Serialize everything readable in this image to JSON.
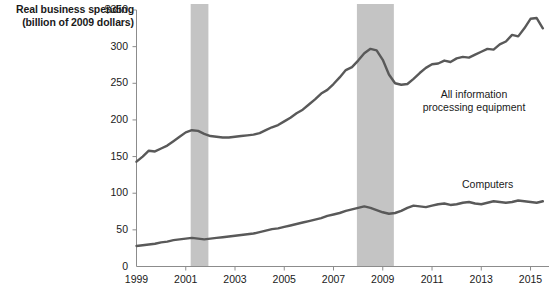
{
  "chart_data": {
    "type": "line",
    "title": "Real business spending (billion of 2009 dollars)",
    "title_line1": "Real business spending",
    "title_line2": "(billion of 2009 dollars)",
    "xlabel": "",
    "ylabel": "Real business spending (billion of 2009 dollars)",
    "ylim": [
      0,
      350
    ],
    "xlim": [
      1999,
      2015.75
    ],
    "y_ticks": [
      0,
      50,
      100,
      150,
      200,
      250,
      300,
      350
    ],
    "y_tick_labels": [
      "0",
      "50",
      "100",
      "150",
      "200",
      "250",
      "300",
      "$350"
    ],
    "x_ticks": [
      1999,
      2001,
      2003,
      2005,
      2007,
      2009,
      2011,
      2013,
      2015
    ],
    "x_tick_labels": [
      "1999",
      "2001",
      "2003",
      "2005",
      "2007",
      "2009",
      "2011",
      "2013",
      "2015"
    ],
    "grid": false,
    "legend_position": "inline-annotations",
    "line_color": "#595959",
    "shaded_band_color": "#c4c4c4",
    "axis_color": "#8c8c8c",
    "recession_bands": [
      {
        "start": 2001.2,
        "end": 2001.92
      },
      {
        "start": 2007.95,
        "end": 2009.45
      }
    ],
    "series": [
      {
        "name": "All information processing equipment",
        "color": "#595959",
        "x": [
          1999.0,
          1999.25,
          1999.5,
          1999.75,
          2000.0,
          2000.25,
          2000.5,
          2000.75,
          2001.0,
          2001.25,
          2001.5,
          2001.75,
          2002.0,
          2002.25,
          2002.5,
          2002.75,
          2003.0,
          2003.25,
          2003.5,
          2003.75,
          2004.0,
          2004.25,
          2004.5,
          2004.75,
          2005.0,
          2005.25,
          2005.5,
          2005.75,
          2006.0,
          2006.25,
          2006.5,
          2006.75,
          2007.0,
          2007.25,
          2007.5,
          2007.75,
          2008.0,
          2008.25,
          2008.5,
          2008.75,
          2009.0,
          2009.25,
          2009.5,
          2009.75,
          2010.0,
          2010.25,
          2010.5,
          2010.75,
          2011.0,
          2011.25,
          2011.5,
          2011.75,
          2012.0,
          2012.25,
          2012.5,
          2012.75,
          2013.0,
          2013.25,
          2013.5,
          2013.75,
          2014.0,
          2014.25,
          2014.5,
          2014.75,
          2015.0,
          2015.25,
          2015.5
        ],
        "values": [
          143,
          150,
          158,
          157,
          161,
          165,
          171,
          177,
          183,
          186,
          185,
          181,
          178,
          177,
          176,
          176,
          177,
          178,
          179,
          180,
          182,
          186,
          190,
          193,
          198,
          203,
          209,
          214,
          221,
          228,
          236,
          241,
          249,
          258,
          268,
          272,
          281,
          291,
          297,
          295,
          282,
          262,
          250,
          248,
          249,
          256,
          264,
          271,
          276,
          277,
          281,
          279,
          284,
          286,
          285,
          289,
          293,
          297,
          296,
          303,
          307,
          316,
          314,
          325,
          338,
          339,
          325
        ]
      },
      {
        "name": "Computers",
        "color": "#595959",
        "x": [
          1999.0,
          1999.25,
          1999.5,
          1999.75,
          2000.0,
          2000.25,
          2000.5,
          2000.75,
          2001.0,
          2001.25,
          2001.5,
          2001.75,
          2002.0,
          2002.25,
          2002.5,
          2002.75,
          2003.0,
          2003.25,
          2003.5,
          2003.75,
          2004.0,
          2004.25,
          2004.5,
          2004.75,
          2005.0,
          2005.25,
          2005.5,
          2005.75,
          2006.0,
          2006.25,
          2006.5,
          2006.75,
          2007.0,
          2007.25,
          2007.5,
          2007.75,
          2008.0,
          2008.25,
          2008.5,
          2008.75,
          2009.0,
          2009.25,
          2009.5,
          2009.75,
          2010.0,
          2010.25,
          2010.5,
          2010.75,
          2011.0,
          2011.25,
          2011.5,
          2011.75,
          2012.0,
          2012.25,
          2012.5,
          2012.75,
          2013.0,
          2013.25,
          2013.5,
          2013.75,
          2014.0,
          2014.25,
          2014.5,
          2014.75,
          2015.0,
          2015.25,
          2015.5
        ],
        "values": [
          28,
          29,
          30,
          31,
          33,
          34,
          36,
          37,
          38,
          39,
          38,
          37,
          38,
          39,
          40,
          41,
          42,
          43,
          44,
          45,
          47,
          49,
          51,
          52,
          54,
          56,
          58,
          60,
          62,
          64,
          66,
          69,
          71,
          73,
          76,
          78,
          80,
          82,
          80,
          77,
          74,
          72,
          73,
          76,
          80,
          83,
          82,
          81,
          83,
          85,
          86,
          84,
          85,
          87,
          88,
          86,
          85,
          87,
          89,
          88,
          87,
          88,
          90,
          89,
          88,
          87,
          89
        ]
      }
    ],
    "annotations": [
      {
        "name": "All information processing equipment",
        "text_line1": "All information",
        "text_line2": "processing equipment"
      },
      {
        "name": "Computers",
        "text": "Computers"
      }
    ]
  },
  "labels": {
    "equipment_line1": "All information",
    "equipment_line2": "processing equipment",
    "computers": "Computers"
  }
}
